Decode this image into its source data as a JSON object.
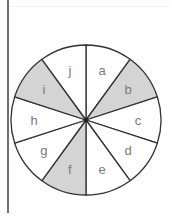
{
  "diagram": {
    "type": "divided-circle",
    "sector_count": 10,
    "center": [
      86,
      120
    ],
    "radius": 75,
    "colors": {
      "shaded": "#d4d4d4",
      "unshaded": "#ffffff",
      "stroke": "#333333",
      "label": "#7a7a7a"
    },
    "sectors": [
      {
        "label": "a",
        "shaded": false
      },
      {
        "label": "b",
        "shaded": true
      },
      {
        "label": "c",
        "shaded": false
      },
      {
        "label": "d",
        "shaded": false
      },
      {
        "label": "e",
        "shaded": false
      },
      {
        "label": "f",
        "shaded": true
      },
      {
        "label": "g",
        "shaded": false
      },
      {
        "label": "h",
        "shaded": false
      },
      {
        "label": "i",
        "shaded": true
      },
      {
        "label": "j",
        "shaded": false
      }
    ]
  }
}
